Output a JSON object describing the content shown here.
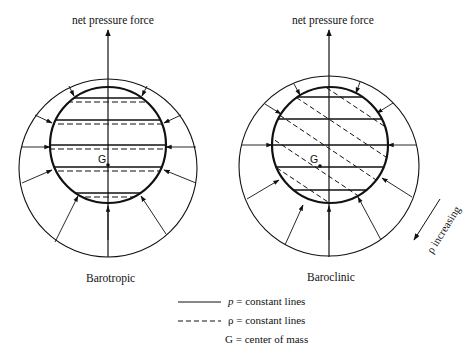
{
  "diagrams": [
    {
      "id": "barotropic",
      "force_label": "net pressure force",
      "caption": "Barotropic",
      "center_label": "G"
    },
    {
      "id": "baroclinic",
      "force_label": "net pressure force",
      "caption": "Baroclinic",
      "center_label": "G",
      "gradient_label": "ρ increasing"
    }
  ],
  "legend": {
    "solid": {
      "symbol": "p",
      "text": "= constant lines"
    },
    "dashed": {
      "symbol": "ρ",
      "text": "= constant lines"
    },
    "center": {
      "symbol": "G",
      "text": "= center of mass"
    }
  },
  "colors": {
    "ink": "#111111",
    "background": "#ffffff"
  }
}
